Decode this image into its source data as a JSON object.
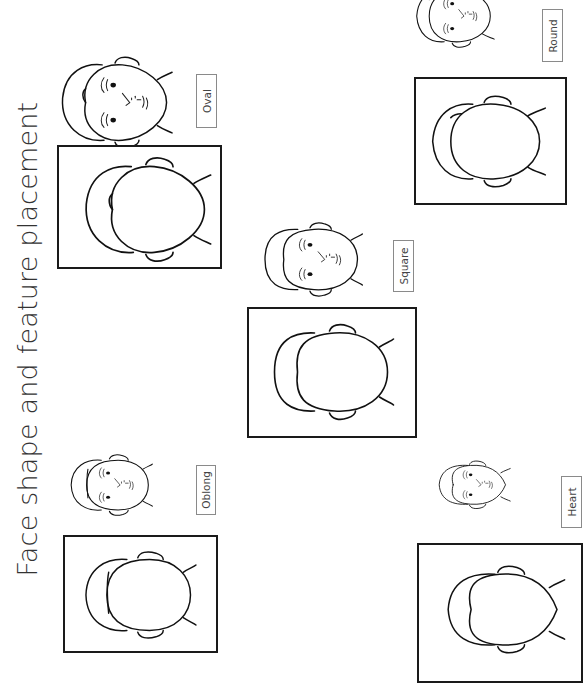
{
  "page": {
    "title": "Face shape and feature placement",
    "orientation": "rotated 90° clockwise"
  },
  "face_shapes": [
    {
      "id": "oval",
      "label": "Oval"
    },
    {
      "id": "square",
      "label": "Square"
    },
    {
      "id": "round",
      "label": "Round"
    },
    {
      "id": "oblong",
      "label": "Oblong"
    },
    {
      "id": "heart",
      "label": "Heart"
    }
  ],
  "icons": {
    "face_with_features": "face-with-features-icon",
    "face_outline": "face-outline-icon"
  }
}
